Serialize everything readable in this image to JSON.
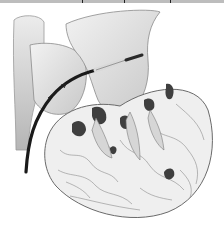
{
  "image": {
    "subject": "Cross-section illustration of the heart with a catheter inserted",
    "style": "grayscale medical pencil illustration",
    "width": 224,
    "height": 228
  },
  "colors": {
    "background": "#ffffff",
    "tissue_light": "#e6e6e6",
    "tissue_mid": "#bdbdbd",
    "tissue_dark": "#4a4a4a",
    "catheter": "#1a1a1a",
    "catheter_tip": "#d9d9d9"
  }
}
